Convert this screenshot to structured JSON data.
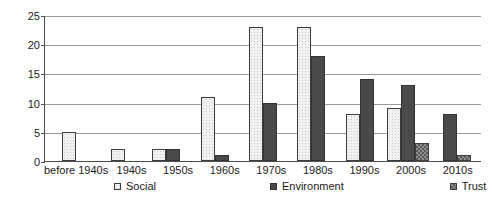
{
  "chart_data": {
    "type": "bar",
    "title": "",
    "subtitle": "",
    "xlabel": "",
    "ylabel": "",
    "ylim": [
      0,
      25
    ],
    "yticks": [
      0,
      5,
      10,
      15,
      20,
      25
    ],
    "grid": true,
    "legend_position": "bottom",
    "categories": [
      "before 1940s",
      "1940s",
      "1950s",
      "1960s",
      "1970s",
      "1980s",
      "1990s",
      "2000s",
      "2010s"
    ],
    "series": [
      {
        "name": "Social",
        "color": "#f2f2f2",
        "values": [
          5,
          2,
          2,
          11,
          23,
          23,
          8,
          9,
          0
        ]
      },
      {
        "name": "Environment",
        "color": "#4a4a4a",
        "values": [
          0,
          0,
          2,
          1,
          10,
          18,
          14,
          13,
          8
        ]
      },
      {
        "name": "Trust",
        "color": "#8c8c8c",
        "values": [
          0,
          0,
          0,
          0,
          0,
          0,
          0,
          3,
          1
        ]
      }
    ]
  }
}
